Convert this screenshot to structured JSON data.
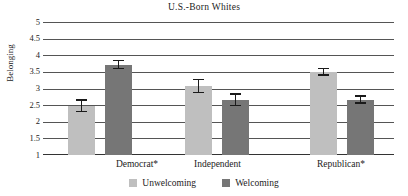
{
  "chart_data": {
    "type": "bar",
    "title": "U.S.-Born Whites",
    "xlabel": "",
    "ylabel": "Belonging",
    "ylim": [
      1,
      5
    ],
    "ytick_labels": [
      "5",
      "4.5",
      "4",
      "3.5",
      "3",
      "2.5",
      "2",
      "1.5",
      "1"
    ],
    "ytick_values": [
      5,
      4.5,
      4,
      3.5,
      3,
      2.5,
      2,
      1.5,
      1
    ],
    "grid": true,
    "legend_position": "bottom",
    "categories": [
      "Democrat*",
      "Independent",
      "Republican*"
    ],
    "series": [
      {
        "name": "Unwelcoming",
        "color": "#bfbfbf",
        "values": [
          2.47,
          3.08,
          3.5
        ],
        "errors_upper": [
          2.67,
          3.3,
          3.62
        ],
        "errors_lower": [
          2.29,
          2.86,
          3.38
        ]
      },
      {
        "name": "Welcoming",
        "color": "#767676",
        "values": [
          3.72,
          2.66,
          2.66
        ],
        "errors_upper": [
          3.87,
          2.85,
          2.79
        ],
        "errors_lower": [
          3.58,
          2.47,
          2.54
        ]
      }
    ],
    "annotations": [
      "* indicates statistically significant difference"
    ]
  },
  "legend": {
    "items": [
      {
        "label": "Unwelcoming",
        "color": "#bfbfbf"
      },
      {
        "label": "Welcoming",
        "color": "#767676"
      }
    ]
  }
}
